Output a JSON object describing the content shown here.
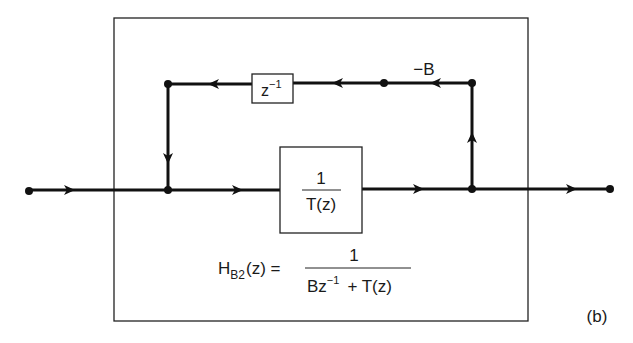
{
  "diagram": {
    "blocks": {
      "delay": {
        "base": "z",
        "exponent": "−1"
      },
      "main": {
        "numerator": "1",
        "denominator": "T(z)"
      }
    },
    "gain_label": "−B",
    "formula": {
      "lhs_main": "H",
      "lhs_sub": "B2",
      "lhs_arg": "(z) =",
      "numerator": "1",
      "den_part1": "Bz",
      "den_exp": "−1",
      "den_part2": "+ T(z)"
    },
    "figure_label": "(b)"
  }
}
